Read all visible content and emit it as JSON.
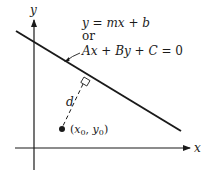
{
  "diagram": {
    "axes": {
      "x_label": "x",
      "y_label": "y"
    },
    "line_equation": {
      "slope_intercept": "y = mx + b",
      "connector": "or",
      "general_form": "Ax + By + C = 0"
    },
    "distance_label": "d",
    "point_label": "(x0, y0)",
    "point_label_parts": {
      "open": "(",
      "x": "x",
      "x_sub": "0",
      "comma": ", ",
      "y": "y",
      "y_sub": "0",
      "close": ")"
    },
    "colors": {
      "stroke": "#1a1a1a",
      "background": "#ffffff"
    }
  }
}
